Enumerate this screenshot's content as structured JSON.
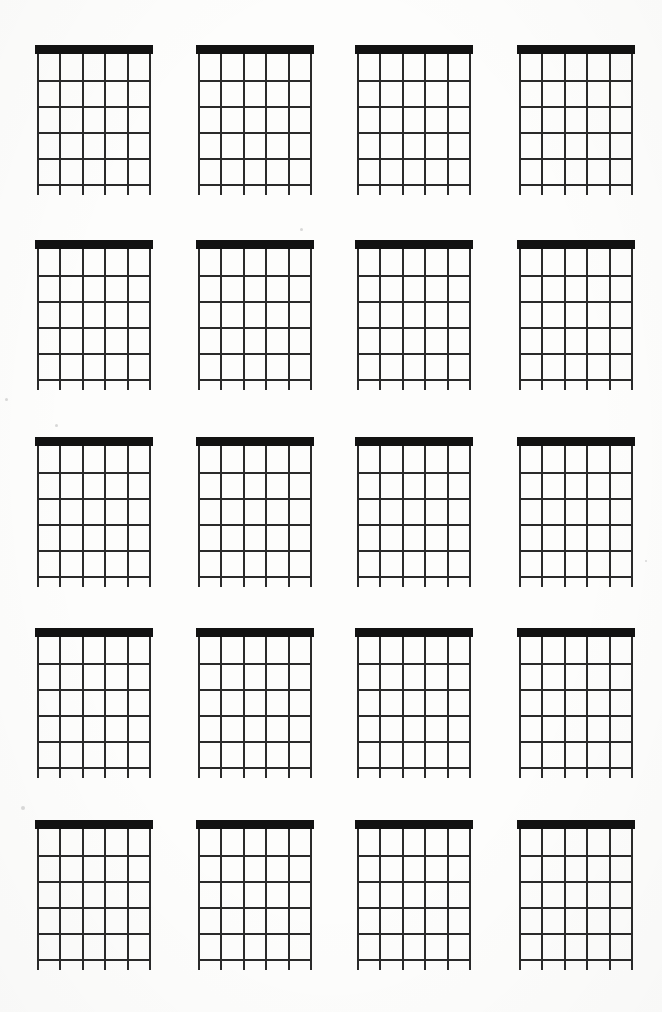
{
  "page": {
    "document_type": "blank-chord-diagram-worksheet",
    "background_color": "#fdfdfc",
    "ink_color": "#121212"
  },
  "layout": {
    "rows": 5,
    "columns": 4,
    "total_diagrams": 20,
    "diagram_width": 114,
    "diagram_height": 150,
    "column_x": [
      37,
      198,
      357,
      519
    ],
    "row_y": [
      45,
      240,
      437,
      628,
      820
    ]
  },
  "diagram": {
    "name": "blank-chord-diagram",
    "strings": 6,
    "frets": 5,
    "fret_lines": 5,
    "string_spacing": 22.4,
    "fret_spacing": 26,
    "nut_height": 9,
    "nut_color": "#121212",
    "line_color": "#2a2a2a",
    "string_overhang": 11,
    "has_nut": true,
    "orientation": "vertical",
    "label": "",
    "fingering": []
  },
  "diagrams": [
    {
      "index": 1,
      "row": 1,
      "column": 1,
      "name": "chord-diagram-r1c1",
      "label": ""
    },
    {
      "index": 2,
      "row": 1,
      "column": 2,
      "name": "chord-diagram-r1c2",
      "label": ""
    },
    {
      "index": 3,
      "row": 1,
      "column": 3,
      "name": "chord-diagram-r1c3",
      "label": ""
    },
    {
      "index": 4,
      "row": 1,
      "column": 4,
      "name": "chord-diagram-r1c4",
      "label": ""
    },
    {
      "index": 5,
      "row": 2,
      "column": 1,
      "name": "chord-diagram-r2c1",
      "label": ""
    },
    {
      "index": 6,
      "row": 2,
      "column": 2,
      "name": "chord-diagram-r2c2",
      "label": ""
    },
    {
      "index": 7,
      "row": 2,
      "column": 3,
      "name": "chord-diagram-r2c3",
      "label": ""
    },
    {
      "index": 8,
      "row": 2,
      "column": 4,
      "name": "chord-diagram-r2c4",
      "label": ""
    },
    {
      "index": 9,
      "row": 3,
      "column": 1,
      "name": "chord-diagram-r3c1",
      "label": ""
    },
    {
      "index": 10,
      "row": 3,
      "column": 2,
      "name": "chord-diagram-r3c2",
      "label": ""
    },
    {
      "index": 11,
      "row": 3,
      "column": 3,
      "name": "chord-diagram-r3c3",
      "label": ""
    },
    {
      "index": 12,
      "row": 3,
      "column": 4,
      "name": "chord-diagram-r3c4",
      "label": ""
    },
    {
      "index": 13,
      "row": 4,
      "column": 1,
      "name": "chord-diagram-r4c1",
      "label": ""
    },
    {
      "index": 14,
      "row": 4,
      "column": 2,
      "name": "chord-diagram-r4c2",
      "label": ""
    },
    {
      "index": 15,
      "row": 4,
      "column": 3,
      "name": "chord-diagram-r4c3",
      "label": ""
    },
    {
      "index": 16,
      "row": 4,
      "column": 4,
      "name": "chord-diagram-r4c4",
      "label": ""
    },
    {
      "index": 17,
      "row": 5,
      "column": 1,
      "name": "chord-diagram-r5c1",
      "label": ""
    },
    {
      "index": 18,
      "row": 5,
      "column": 2,
      "name": "chord-diagram-r5c2",
      "label": ""
    },
    {
      "index": 19,
      "row": 5,
      "column": 3,
      "name": "chord-diagram-r5c3",
      "label": ""
    },
    {
      "index": 20,
      "row": 5,
      "column": 4,
      "name": "chord-diagram-r5c4",
      "label": ""
    }
  ],
  "artifacts": {
    "speckles": [
      {
        "x": 5,
        "y": 398,
        "size": 3
      },
      {
        "x": 55,
        "y": 424,
        "size": 3
      },
      {
        "x": 21,
        "y": 806,
        "size": 4
      },
      {
        "x": 300,
        "y": 228,
        "size": 3
      },
      {
        "x": 645,
        "y": 560,
        "size": 2
      }
    ]
  }
}
